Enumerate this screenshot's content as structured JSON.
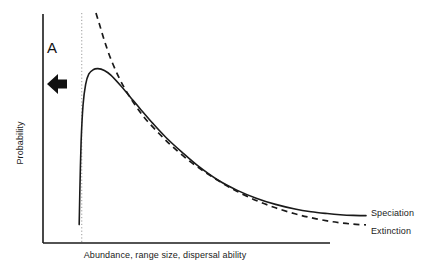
{
  "figure": {
    "background_color": "#ffffff",
    "line_color": "#1a1a1a",
    "annotation_color": "#111111",
    "guide_color": "#9a9a9a"
  },
  "axes": {
    "x_label": "Abundance, range size, dispersal ability",
    "y_label": "Probability",
    "x_axis_name": "x-axis-line",
    "y_axis_name": "y-axis-line",
    "ticks": [],
    "grid": false
  },
  "annotations": [
    {
      "id": "a",
      "label": "A",
      "arrow": "left-arrow",
      "arrow_direction": "left"
    }
  ],
  "legend": {
    "position": "right",
    "entries": [
      {
        "label": "Speciation",
        "style": "solid"
      },
      {
        "label": "Extinction",
        "style": "dashed"
      }
    ]
  },
  "chart_data": {
    "type": "line",
    "title": "",
    "xlabel": "Abundance, range size, dispersal ability",
    "ylabel": "Probability",
    "xlim": [
      0,
      100
    ],
    "ylim": [
      0,
      100
    ],
    "grid": false,
    "axis_ticks_shown": false,
    "legend_position": "right",
    "annotations": [
      {
        "text": "A",
        "x": 4,
        "y": 86,
        "arrow": "left",
        "arrow_x": 5,
        "arrow_y": 73
      }
    ],
    "guides": [
      {
        "name": "peak-threshold-dotted-line",
        "type": "vertical-dotted",
        "x": 12,
        "y_from": 0,
        "y_to": 100
      }
    ],
    "series": [
      {
        "name": "Speciation",
        "style": "solid",
        "x": [
          11.2,
          11.4,
          11.8,
          12.4,
          13.2,
          14.2,
          15.5,
          17.0,
          19.0,
          21.0,
          24.0,
          27.0,
          30.0,
          34.0,
          38.0,
          43.0,
          48.0,
          54.0,
          60.0,
          66.0,
          72.0,
          78.0,
          83.0,
          88.0,
          92.0,
          96.0,
          100.0
        ],
        "y": [
          8.0,
          22.0,
          44.0,
          60.0,
          69.0,
          73.5,
          75.3,
          75.8,
          75.0,
          73.0,
          68.5,
          63.5,
          58.5,
          52.0,
          46.0,
          39.5,
          33.5,
          27.5,
          23.0,
          19.5,
          16.8,
          14.8,
          13.6,
          12.8,
          12.3,
          12.0,
          11.9
        ]
      },
      {
        "name": "Extinction",
        "style": "dashed",
        "x": [
          16.4,
          17.5,
          19.0,
          21.0,
          23.5,
          26.0,
          29.0,
          32.0,
          36.0,
          40.0,
          45.0,
          50.0,
          55.0,
          60.0,
          66.0,
          72.0,
          78.0,
          83.0,
          88.0,
          92.0,
          96.0,
          100.0
        ],
        "y": [
          100.0,
          95.0,
          88.0,
          80.0,
          72.0,
          65.5,
          59.0,
          53.5,
          47.5,
          42.0,
          36.0,
          31.0,
          26.5,
          22.5,
          18.5,
          15.3,
          12.7,
          11.0,
          9.6,
          8.8,
          8.2,
          7.9
        ]
      }
    ]
  }
}
